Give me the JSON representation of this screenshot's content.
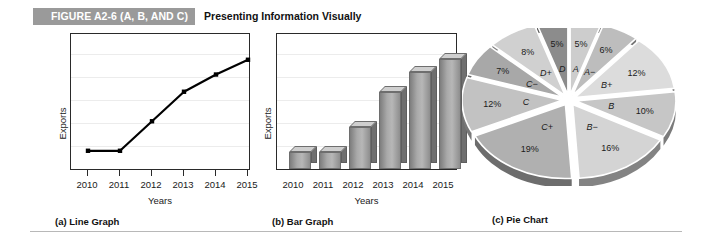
{
  "header": {
    "badge": "FIGURE A2-6 (A, B, AND C)",
    "subtitle": "Presenting Information Visually",
    "badge_color": "#9a9a9a",
    "badge_text_color": "#ffffff"
  },
  "panels": [
    {
      "caption_index": "(a)",
      "caption_label": "Line Graph"
    },
    {
      "caption_index": "(b)",
      "caption_label": "Bar Graph"
    },
    {
      "caption_index": "(c)",
      "caption_label": "Pie Chart"
    }
  ],
  "chart_data": [
    {
      "type": "line",
      "title": "",
      "xlabel": "Years",
      "ylabel": "Exports",
      "categories": [
        "2010",
        "2011",
        "2012",
        "2013",
        "2014",
        "2015"
      ],
      "values": [
        14,
        14,
        38,
        62,
        76,
        88
      ],
      "ylim": [
        0,
        100
      ],
      "y_ticks_labeled": false,
      "grid": true,
      "legend": "none",
      "marker": "filled-square",
      "line_color": "#000000"
    },
    {
      "type": "bar",
      "title": "",
      "xlabel": "Years",
      "ylabel": "Exports",
      "categories": [
        "2010",
        "2011",
        "2012",
        "2013",
        "2014",
        "2015"
      ],
      "values": [
        14,
        14,
        34,
        62,
        78,
        88
      ],
      "ylim": [
        0,
        100
      ],
      "y_ticks_labeled": false,
      "grid": true,
      "legend": "none",
      "bar_style": "3d",
      "bar_color": "#a9a9a9"
    },
    {
      "type": "pie",
      "title": "",
      "legend": "none",
      "labels_inside": true,
      "exploded": true,
      "style": "3d",
      "slices": [
        {
          "grade": "A",
          "percent": 5,
          "percent_label": "5%",
          "color": "#cdcdcd"
        },
        {
          "grade": "A−",
          "percent": 6,
          "percent_label": "6%",
          "color": "#bdbdbd"
        },
        {
          "grade": "B+",
          "percent": 12,
          "percent_label": "12%",
          "color": "#dcdcdc"
        },
        {
          "grade": "B",
          "percent": 10,
          "percent_label": "10%",
          "color": "#c6c6c6"
        },
        {
          "grade": "B−",
          "percent": 16,
          "percent_label": "16%",
          "color": "#d4d4d4"
        },
        {
          "grade": "C+",
          "percent": 19,
          "percent_label": "19%",
          "color": "#b0b0b0"
        },
        {
          "grade": "C",
          "percent": 12,
          "percent_label": "12%",
          "color": "#c2c2c2"
        },
        {
          "grade": "C−",
          "percent": 7,
          "percent_label": "7%",
          "color": "#a8a8a8"
        },
        {
          "grade": "D+",
          "percent": 8,
          "percent_label": "8%",
          "color": "#d0d0d0"
        },
        {
          "grade": "D",
          "percent": 5,
          "percent_label": "5%",
          "color": "#8c8c8c"
        }
      ]
    }
  ]
}
